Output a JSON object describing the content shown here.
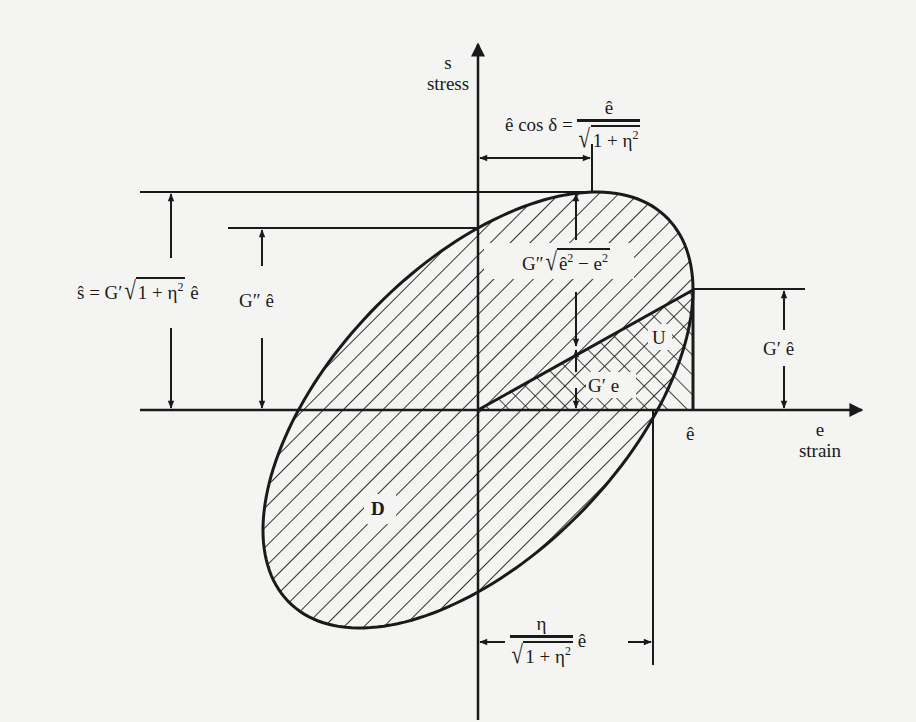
{
  "figure": {
    "axes": {
      "vertical": {
        "symbol": "s",
        "name": "stress"
      },
      "horizontal": {
        "symbol": "e",
        "name": "strain"
      }
    },
    "labels": {
      "peak_stress": "ŝ = G′√(1+η²) ê",
      "peak_stress_lhs": "ŝ = G′",
      "loss_stress": "G″ ê",
      "loss_stress_G": "G″",
      "strain_cos_delta_lhs": "ê cos δ =",
      "strain_cos_delta_num": "ê",
      "sqrt_arg": "1 + η",
      "storage_stress": "G′ ê",
      "storage_G": "G′",
      "loss_component": "G″√(ê² − e²)",
      "loss_component_G": "G″",
      "loss_component_arg": "ê",
      "loss_component_arg2": " − e",
      "elastic_stress": "G′ e",
      "stored_energy": "U",
      "dissipated_energy": "D",
      "peak_strain": "ê",
      "offset": "η / √(1+η²) ê",
      "offset_num": "η",
      "hat_e": "e",
      "square": "2"
    },
    "geometry": {
      "origin": [
        478,
        410
      ],
      "e_hat_px": 215,
      "G_prime_e_hat_px": 120,
      "G_double_prime_e_hat_px": 182
    },
    "colors": {
      "ink": "#1a1a1a",
      "paper": "#f4f4f2"
    }
  }
}
